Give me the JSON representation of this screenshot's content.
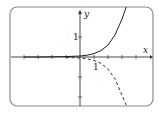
{
  "chart_data": {
    "type": "line",
    "title": "",
    "xlabel": "x",
    "ylabel": "y",
    "xlim": [
      -4,
      5
    ],
    "ylim": [
      -2.4,
      2.5
    ],
    "xticks": [
      -4,
      -3,
      -2,
      -1,
      0,
      1,
      2,
      3,
      4
    ],
    "yticks": [
      -2,
      -1,
      1
    ],
    "tick_labels": {
      "x": [
        "1"
      ],
      "y": [
        "1"
      ]
    },
    "grid": false,
    "legend": null,
    "series": [
      {
        "name": "solid curve",
        "style": "solid",
        "color": "#222222",
        "x": [
          -4,
          -3,
          -2,
          -1,
          0,
          0.5,
          1,
          1.5,
          2,
          2.5,
          3,
          3.3
        ],
        "y": [
          0.0,
          0.0,
          0.01,
          0.02,
          0.05,
          0.09,
          0.17,
          0.32,
          0.6,
          1.1,
          1.9,
          2.5
        ]
      },
      {
        "name": "dashed curve",
        "style": "dashed",
        "color": "#333333",
        "x": [
          -1,
          0,
          0.5,
          1,
          1.5,
          2,
          2.5,
          3,
          3.3
        ],
        "y": [
          -0.02,
          -0.05,
          -0.09,
          -0.17,
          -0.32,
          -0.6,
          -1.1,
          -1.9,
          -2.4
        ]
      }
    ]
  },
  "labels": {
    "x_axis": "x",
    "y_axis": "y",
    "x_one": "1",
    "y_one": "1"
  },
  "colors": {
    "frame": "#8a8a8a",
    "axis": "#333333",
    "curve": "#222222"
  }
}
